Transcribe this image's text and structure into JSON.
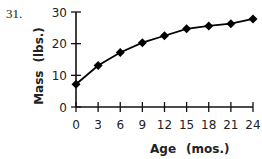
{
  "question_number": "31.",
  "chart_data": {
    "type": "line",
    "title": "",
    "xlabel": "Age (mos.)",
    "ylabel": "Mass (lbs.)",
    "x": [
      0,
      3,
      6,
      9,
      12,
      15,
      18,
      21,
      24
    ],
    "series": [
      {
        "name": "Mass",
        "values": [
          7.2,
          13.1,
          17.2,
          20.3,
          22.5,
          24.7,
          25.6,
          26.3,
          27.8
        ],
        "marker": "diamond",
        "color": "#000000"
      }
    ],
    "xlim": [
      0,
      24
    ],
    "ylim": [
      0,
      30
    ],
    "xticks": [
      0,
      3,
      6,
      9,
      12,
      15,
      18,
      21,
      24
    ],
    "yticks": [
      0,
      10,
      20,
      30
    ],
    "grid": false,
    "legend": null
  },
  "labels": {
    "x_title": "Age",
    "x_unit": "(mos.)",
    "y_title": "Mass",
    "y_unit": "(lbs.)"
  }
}
